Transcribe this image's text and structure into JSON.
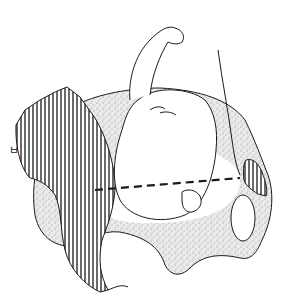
{
  "figure": {
    "label": "ㅂ",
    "colors": {
      "outline": "#1a1a1a",
      "stipple_fill": "#e6e6e6",
      "hatch": "#1a1a1a",
      "background": "#ffffff"
    },
    "regions": [
      {
        "name": "left-sacral-hatched",
        "fill": "vertical-hatch"
      },
      {
        "name": "right-pubic-hatched",
        "fill": "vertical-hatch"
      },
      {
        "name": "pelvis-bone",
        "fill": "stipple"
      },
      {
        "name": "obturator-foramen",
        "fill": "none"
      },
      {
        "name": "fetal-head",
        "fill": "none"
      },
      {
        "name": "fetal-arm",
        "fill": "none"
      },
      {
        "name": "fetal-hand",
        "fill": "none"
      }
    ],
    "dashed_line": {
      "from": [
        95,
        190
      ],
      "to": [
        240,
        178
      ],
      "style": "dashed"
    }
  }
}
